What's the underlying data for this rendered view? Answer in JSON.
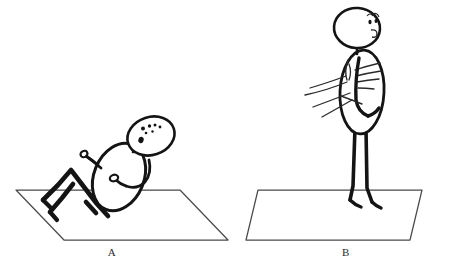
{
  "figure": {
    "type": "line-drawing",
    "medium": "hand-drawn ink sketch",
    "background_color": "#ffffff",
    "ink_color": "#1a1a1a",
    "mat_line_color": "#3a3a3a",
    "panel_count": 2
  },
  "panels": [
    {
      "id": "A",
      "label": "A",
      "label_position": {
        "x": 112,
        "y": 252
      },
      "description": "figure reclining on mat with knees bent",
      "mat": {
        "name": "exercise-mat",
        "shape": "parallelogram",
        "points": "16,190 180,190 228,240 64,240"
      },
      "body": {
        "head": {
          "cx": 151,
          "cy": 136,
          "rx": 24,
          "ry": 19,
          "rotation": -18
        },
        "face_dots": [
          {
            "x": 143,
            "y": 128,
            "r": 2.0
          },
          {
            "x": 149,
            "y": 126,
            "r": 1.7
          },
          {
            "x": 154,
            "y": 125,
            "r": 1.5
          },
          {
            "x": 159,
            "y": 127,
            "r": 1.4
          },
          {
            "x": 146,
            "y": 133,
            "r": 1.3
          },
          {
            "x": 152,
            "y": 131,
            "r": 1.2
          },
          {
            "x": 141,
            "y": 140,
            "r": 2.4
          }
        ],
        "torso": {
          "cx": 119,
          "cy": 177,
          "rx": 25,
          "ry": 35,
          "rotation": 22
        },
        "arms": "raised and bent",
        "legs": "zigzag, knees bent upward"
      }
    },
    {
      "id": "B",
      "label": "B",
      "label_position": {
        "x": 346,
        "y": 252
      },
      "description": "figure standing upright on mat with motion lines at arms",
      "mat": {
        "name": "exercise-mat",
        "shape": "parallelogram",
        "points": "258,190 422,190 410,240 246,240"
      },
      "body": {
        "head": {
          "cx": 357,
          "cy": 28,
          "rx": 23,
          "ry": 20,
          "rotation": 5
        },
        "face_marks": "eye and mouth curl on right of head",
        "torso": {
          "cx": 362,
          "cy": 92,
          "rx": 22,
          "ry": 42,
          "rotation": 4
        },
        "arms": "bent across chest",
        "legs": "two long straight legs with small feet",
        "motion_lines": 5
      }
    }
  ],
  "captions": {
    "a": "A",
    "b": "B"
  }
}
